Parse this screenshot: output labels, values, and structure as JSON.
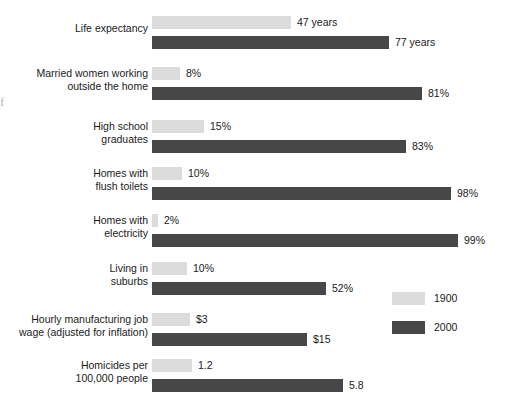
{
  "chart_data": {
    "type": "bar",
    "title": "",
    "subtitle": "",
    "xlabel": "",
    "ylabel": "",
    "orientation": "horizontal",
    "grid": false,
    "legend_position": "right-middle",
    "note": "Each row is independently scaled; bar lengths are proportional within a row only.",
    "categories": [
      "Life expectancy",
      "Married women working outside the home",
      "High school graduates",
      "Homes with flush toilets",
      "Homes with electricity",
      "Living in suburbs",
      "Hourly manufacturing job wage (adjusted for inflation)",
      "Homicides per 100,000 people"
    ],
    "series": [
      {
        "name": "1900",
        "color": "#dcdcdc",
        "values": [
          47,
          8,
          15,
          10,
          2,
          10,
          3,
          1.2
        ],
        "labels": [
          "47 years",
          "8%",
          "15%",
          "10%",
          "2%",
          "10%",
          "$3",
          "1.2"
        ]
      },
      {
        "name": "2000",
        "color": "#474747",
        "values": [
          77,
          81,
          83,
          98,
          99,
          52,
          15,
          5.8
        ],
        "labels": [
          "77 years",
          "81%",
          "83%",
          "98%",
          "99%",
          "52%",
          "$15",
          "5.8"
        ]
      }
    ]
  },
  "rows": [
    {
      "label": "Life expectancy",
      "top": 16,
      "label_top": 22,
      "bars": [
        {
          "series": 0,
          "top": 0,
          "width": 139,
          "value": "47 years"
        },
        {
          "series": 1,
          "top": 20,
          "width": 237,
          "value": "77 years"
        }
      ]
    },
    {
      "label": "Married women working\noutside the home",
      "top": 67,
      "label_top": 67,
      "bars": [
        {
          "series": 0,
          "top": 0,
          "width": 28,
          "value": "8%"
        },
        {
          "series": 1,
          "top": 20,
          "width": 270,
          "value": "81%"
        }
      ]
    },
    {
      "label": "High school\ngraduates",
      "top": 120,
      "label_top": 120,
      "bars": [
        {
          "series": 0,
          "top": 0,
          "width": 52,
          "value": "15%"
        },
        {
          "series": 1,
          "top": 20,
          "width": 254,
          "value": "83%"
        }
      ]
    },
    {
      "label": "Homes with\nflush toilets",
      "top": 167,
      "label_top": 167,
      "bars": [
        {
          "series": 0,
          "top": 0,
          "width": 30,
          "value": "10%"
        },
        {
          "series": 1,
          "top": 20,
          "width": 299,
          "value": "98%"
        }
      ]
    },
    {
      "label": "Homes with\nelectricity",
      "top": 214,
      "label_top": 214,
      "bars": [
        {
          "series": 0,
          "top": 0,
          "width": 6,
          "value": "2%"
        },
        {
          "series": 1,
          "top": 20,
          "width": 306,
          "value": "99%"
        }
      ]
    },
    {
      "label": "Living in\nsuburbs",
      "top": 262,
      "label_top": 262,
      "bars": [
        {
          "series": 0,
          "top": 0,
          "width": 35,
          "value": "10%"
        },
        {
          "series": 1,
          "top": 20,
          "width": 174,
          "value": "52%"
        }
      ]
    },
    {
      "label": "Hourly manufacturing job\nwage (adjusted for inflation)",
      "top": 313,
      "label_top": 313,
      "bars": [
        {
          "series": 0,
          "top": 0,
          "width": 38,
          "value": "$3"
        },
        {
          "series": 1,
          "top": 20,
          "width": 155,
          "value": "$15"
        }
      ]
    },
    {
      "label": "Homicides per\n100,000 people",
      "top": 359,
      "label_top": 359,
      "bars": [
        {
          "series": 0,
          "top": 0,
          "width": 40,
          "value": "1.2"
        },
        {
          "series": 1,
          "top": 20,
          "width": 191,
          "value": "5.8"
        }
      ]
    }
  ],
  "legend": {
    "items": [
      {
        "label": "1900",
        "swatch": "light"
      },
      {
        "label": "2000",
        "swatch": "dark"
      }
    ]
  },
  "artifact": {
    "glyph": "f"
  }
}
